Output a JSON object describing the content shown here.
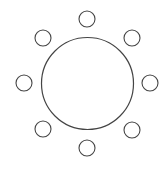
{
  "diagram": {
    "stroke_color": "#444444",
    "fill_color": "#ffffff",
    "center_circle": {
      "cx": 87.5,
      "cy": 83.5,
      "r": 46
    },
    "satellites": [
      {
        "name": "top",
        "cx": 87,
        "cy": 19,
        "r": 8
      },
      {
        "name": "top-right",
        "cx": 132,
        "cy": 38,
        "r": 8
      },
      {
        "name": "right",
        "cx": 150,
        "cy": 83,
        "r": 8
      },
      {
        "name": "bottom-right",
        "cx": 132,
        "cy": 130,
        "r": 8
      },
      {
        "name": "bottom",
        "cx": 87,
        "cy": 148,
        "r": 8
      },
      {
        "name": "bottom-left",
        "cx": 43,
        "cy": 129,
        "r": 8
      },
      {
        "name": "left",
        "cx": 24,
        "cy": 83,
        "r": 8
      },
      {
        "name": "top-left",
        "cx": 43,
        "cy": 38,
        "r": 8
      }
    ]
  }
}
